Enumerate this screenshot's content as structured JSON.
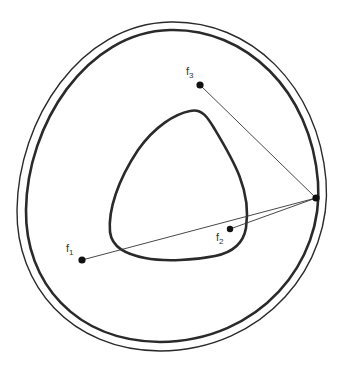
{
  "diagram": {
    "colors": {
      "stroke": "#2a2a2a",
      "background": "#ffffff"
    },
    "curves": [
      {
        "name": "outer-curve-thin",
        "weight": "thin"
      },
      {
        "name": "outer-curve-thick",
        "weight": "thick"
      },
      {
        "name": "inner-curve",
        "weight": "thick",
        "shape": "rounded-triangle"
      }
    ],
    "foci": [
      {
        "id": "f1",
        "base": "f",
        "sub": "1",
        "x": 82,
        "y": 260
      },
      {
        "id": "f2",
        "base": "f",
        "sub": "2",
        "x": 230,
        "y": 229
      },
      {
        "id": "f3",
        "base": "f",
        "sub": "3",
        "x": 200,
        "y": 85
      }
    ],
    "point": {
      "id": "P",
      "x": 316,
      "y": 198
    },
    "segments": [
      {
        "from": "P",
        "to": "f1"
      },
      {
        "from": "P",
        "to": "f2"
      },
      {
        "from": "P",
        "to": "f3"
      }
    ]
  }
}
